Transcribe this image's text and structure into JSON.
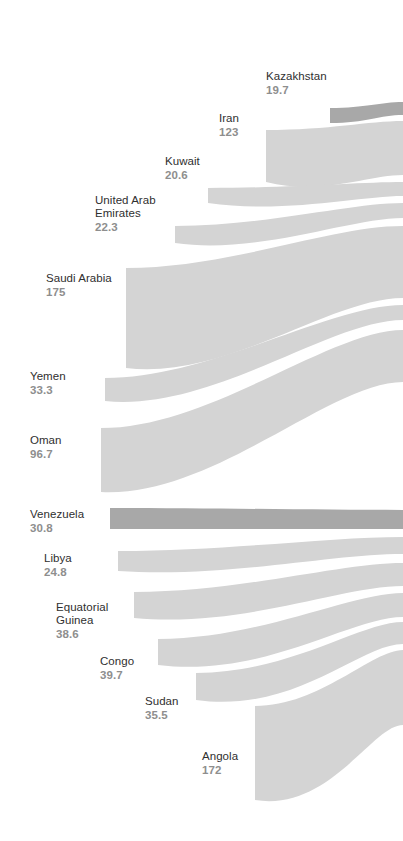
{
  "figure": {
    "type": "sankey-flow-diagram",
    "background_color": "#ffffff",
    "ribbon_color_default": "#d4d4d4",
    "ribbon_color_highlight": "#a8a8a8",
    "label_name_color": "#2f2f2f",
    "label_value_color": "#8e8e8e"
  },
  "chart_data": {
    "type": "sankey",
    "title": "",
    "subtitle": "",
    "xlabel": "",
    "ylabel": "",
    "legend_position": "none",
    "grid": false,
    "value_unit": "",
    "orientation": "left-to-right",
    "categories": [
      "Kazakhstan",
      "Iran",
      "Kuwait",
      "United Arab Emirates",
      "Saudi Arabia",
      "Yemen",
      "Oman",
      "Venezuela",
      "Libya",
      "Equatorial Guinea",
      "Congo",
      "Sudan",
      "Angola"
    ],
    "values": [
      19.7,
      123,
      20.6,
      22.3,
      175,
      33.3,
      96.7,
      30.8,
      24.8,
      38.6,
      39.7,
      35.5,
      172
    ],
    "series": [
      {
        "name": "flow",
        "values": [
          19.7,
          123,
          20.6,
          22.3,
          175,
          33.3,
          96.7,
          30.8,
          24.8,
          38.6,
          39.7,
          35.5,
          172
        ]
      }
    ],
    "highlighted": [
      "Kazakhstan",
      "Venezuela"
    ]
  },
  "nodes": [
    {
      "id": "kazakhstan",
      "name": "Kazakhstan",
      "value": "19.7",
      "highlight": true,
      "label": {
        "x": 266,
        "y": 70,
        "align": "left"
      },
      "ribbon": {
        "left_x": 330,
        "left_top": 108,
        "left_bottom": 123,
        "right_x": 403,
        "right_top": 102,
        "right_bottom": 115,
        "c1x": 366,
        "c1y": 108,
        "c2x": 380,
        "c2y": 102,
        "d1x": 380,
        "d1y": 115,
        "d2x": 366,
        "d2y": 123
      }
    },
    {
      "id": "iran",
      "name": "Iran",
      "value": "123",
      "highlight": false,
      "label": {
        "x": 219,
        "y": 112,
        "align": "left"
      },
      "ribbon": {
        "left_x": 266,
        "left_top": 130,
        "left_bottom": 182,
        "right_x": 403,
        "right_top": 121,
        "right_bottom": 175,
        "c1x": 330,
        "c1y": 130,
        "c2x": 368,
        "c2y": 121,
        "d1x": 368,
        "d1y": 175,
        "d2x": 322,
        "d2y": 196
      }
    },
    {
      "id": "kuwait",
      "name": "Kuwait",
      "value": "20.6",
      "highlight": false,
      "label": {
        "x": 165,
        "y": 155,
        "align": "left"
      },
      "ribbon": {
        "left_x": 208,
        "left_top": 188,
        "left_bottom": 203,
        "right_x": 403,
        "right_top": 182,
        "right_bottom": 196,
        "c1x": 290,
        "c1y": 188,
        "c2x": 360,
        "c2y": 182,
        "d1x": 360,
        "d1y": 196,
        "d2x": 284,
        "d2y": 214
      }
    },
    {
      "id": "uae",
      "name": "United Arab\nEmirates",
      "value": "22.3",
      "highlight": false,
      "label": {
        "x": 95,
        "y": 194,
        "align": "left"
      },
      "ribbon": {
        "left_x": 175,
        "left_top": 226,
        "left_bottom": 243,
        "right_x": 403,
        "right_top": 203,
        "right_bottom": 218,
        "c1x": 265,
        "c1y": 226,
        "c2x": 350,
        "c2y": 203,
        "d1x": 350,
        "d1y": 218,
        "d2x": 258,
        "d2y": 255
      }
    },
    {
      "id": "saudi-arabia",
      "name": "Saudi Arabia",
      "value": "175",
      "highlight": false,
      "label": {
        "x": 46,
        "y": 272,
        "align": "left"
      },
      "ribbon": {
        "left_x": 126,
        "left_top": 268,
        "left_bottom": 368,
        "right_x": 403,
        "right_top": 226,
        "right_bottom": 298,
        "c1x": 230,
        "c1y": 268,
        "c2x": 330,
        "c2y": 226,
        "d1x": 330,
        "d1y": 298,
        "d2x": 228,
        "d2y": 380
      }
    },
    {
      "id": "yemen",
      "name": "Yemen",
      "value": "33.3",
      "highlight": false,
      "label": {
        "x": 30,
        "y": 370,
        "align": "left"
      },
      "ribbon": {
        "left_x": 105,
        "left_top": 378,
        "left_bottom": 401,
        "right_x": 403,
        "right_top": 305,
        "right_bottom": 320,
        "c1x": 210,
        "c1y": 378,
        "c2x": 330,
        "c2y": 305,
        "d1x": 330,
        "d1y": 320,
        "d2x": 212,
        "d2y": 412
      }
    },
    {
      "id": "oman",
      "name": "Oman",
      "value": "96.7",
      "highlight": false,
      "label": {
        "x": 30,
        "y": 434,
        "align": "left"
      },
      "ribbon": {
        "left_x": 101,
        "left_top": 428,
        "left_bottom": 492,
        "right_x": 403,
        "right_top": 330,
        "right_bottom": 382,
        "c1x": 210,
        "c1y": 428,
        "c2x": 330,
        "c2y": 330,
        "d1x": 330,
        "d1y": 382,
        "d2x": 212,
        "d2y": 498
      }
    },
    {
      "id": "venezuela",
      "name": "Venezuela",
      "value": "30.8",
      "highlight": true,
      "label": {
        "x": 30,
        "y": 508,
        "align": "left"
      },
      "ribbon": {
        "left_x": 110,
        "left_top": 508,
        "left_bottom": 529,
        "right_x": 403,
        "right_top": 510,
        "right_bottom": 529,
        "c1x": 220,
        "c1y": 508,
        "c2x": 320,
        "c2y": 510,
        "d1x": 320,
        "d1y": 529,
        "d2x": 220,
        "d2y": 529
      }
    },
    {
      "id": "libya",
      "name": "Libya",
      "value": "24.8",
      "highlight": false,
      "label": {
        "x": 44,
        "y": 552,
        "align": "left"
      },
      "ribbon": {
        "left_x": 118,
        "left_top": 551,
        "left_bottom": 571,
        "right_x": 403,
        "right_top": 537,
        "right_bottom": 554,
        "c1x": 225,
        "c1y": 551,
        "c2x": 330,
        "c2y": 537,
        "d1x": 330,
        "d1y": 554,
        "d2x": 228,
        "d2y": 578
      }
    },
    {
      "id": "equatorial-guinea",
      "name": "Equatorial\nGuinea",
      "value": "38.6",
      "highlight": false,
      "label": {
        "x": 56,
        "y": 601,
        "align": "left"
      },
      "ribbon": {
        "left_x": 134,
        "left_top": 592,
        "left_bottom": 618,
        "right_x": 403,
        "right_top": 563,
        "right_bottom": 586,
        "c1x": 240,
        "c1y": 592,
        "c2x": 340,
        "c2y": 563,
        "d1x": 340,
        "d1y": 586,
        "d2x": 244,
        "d2y": 628
      }
    },
    {
      "id": "congo",
      "name": "Congo",
      "value": "39.7",
      "highlight": false,
      "label": {
        "x": 100,
        "y": 655,
        "align": "left"
      },
      "ribbon": {
        "left_x": 158,
        "left_top": 639,
        "left_bottom": 665,
        "right_x": 403,
        "right_top": 593,
        "right_bottom": 617,
        "c1x": 260,
        "c1y": 639,
        "c2x": 350,
        "c2y": 593,
        "d1x": 350,
        "d1y": 617,
        "d2x": 266,
        "d2y": 678
      }
    },
    {
      "id": "sudan",
      "name": "Sudan",
      "value": "35.5",
      "highlight": false,
      "label": {
        "x": 145,
        "y": 695,
        "align": "left"
      },
      "ribbon": {
        "left_x": 196,
        "left_top": 673,
        "left_bottom": 700,
        "right_x": 403,
        "right_top": 622,
        "right_bottom": 644,
        "c1x": 290,
        "c1y": 673,
        "c2x": 360,
        "c2y": 622,
        "d1x": 360,
        "d1y": 644,
        "d2x": 296,
        "d2y": 714
      }
    },
    {
      "id": "angola",
      "name": "Angola",
      "value": "172",
      "highlight": false,
      "label": {
        "x": 202,
        "y": 750,
        "align": "left"
      },
      "ribbon": {
        "left_x": 255,
        "left_top": 706,
        "left_bottom": 800,
        "right_x": 403,
        "right_top": 650,
        "right_bottom": 725,
        "c1x": 320,
        "c1y": 706,
        "c2x": 372,
        "c2y": 650,
        "d1x": 372,
        "d1y": 725,
        "d2x": 330,
        "d2y": 812
      }
    }
  ]
}
